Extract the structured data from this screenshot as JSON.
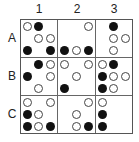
{
  "columns": [
    "1",
    "2",
    "3"
  ],
  "rows": [
    "A",
    "B",
    "C"
  ],
  "legend": {
    "b": "black-dot",
    "w": "white-dot",
    "_": "empty"
  },
  "colors": {
    "black": "#111111",
    "white": "#ffffff",
    "line": "#555555"
  },
  "cells": {
    "A1": [
      [
        "w",
        "b",
        "_"
      ],
      [
        "_",
        "w",
        "w"
      ],
      [
        "b",
        "_",
        "b"
      ]
    ],
    "A2": [
      [
        "_",
        "_",
        "w"
      ],
      [
        "_",
        "_",
        "_"
      ],
      [
        "b",
        "w",
        "b"
      ]
    ],
    "A3": [
      [
        "_",
        "b",
        "_"
      ],
      [
        "_",
        "w",
        "w"
      ],
      [
        "_",
        "w",
        "_"
      ]
    ],
    "B1": [
      [
        "_",
        "b",
        "w"
      ],
      [
        "b",
        "_",
        "w"
      ],
      [
        "_",
        "w",
        "_"
      ]
    ],
    "B2": [
      [
        "w",
        "_",
        "w"
      ],
      [
        "_",
        "w",
        "_"
      ],
      [
        "b",
        "_",
        "_"
      ]
    ],
    "B3": [
      [
        "w",
        "b",
        "_"
      ],
      [
        "b",
        "w",
        "w"
      ],
      [
        "b",
        "w",
        "_"
      ]
    ],
    "C1": [
      [
        "w",
        "_",
        "w"
      ],
      [
        "b",
        "w",
        "_"
      ],
      [
        "b",
        "w",
        "b"
      ]
    ],
    "C2": [
      [
        "_",
        "_",
        "w"
      ],
      [
        "_",
        "w",
        "_"
      ],
      [
        "_",
        "w",
        "b"
      ]
    ],
    "C3": [
      [
        "w",
        "_",
        "_"
      ],
      [
        "b",
        "_",
        "_"
      ],
      [
        "b",
        "_",
        "_"
      ]
    ]
  }
}
